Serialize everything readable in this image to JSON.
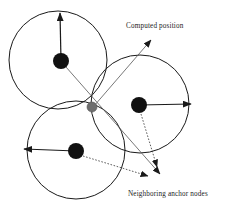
{
  "figure": {
    "type": "diagram",
    "width": 232,
    "height": 210,
    "background": "#ffffff"
  },
  "labels": {
    "computed_position": "Computed position",
    "neighboring_anchor_nodes": "Neighboring anchor nodes"
  },
  "colors": {
    "stroke": "#1a1a1a",
    "anchor_node_fill": "#111111",
    "computed_node_fill": "#6e6e6e",
    "leader_line": "#4a4a4a",
    "circle_stroke": "#1a1a1a",
    "text": "#1a1a1a",
    "background": "#ffffff"
  },
  "geometry": {
    "circles": [
      {
        "name": "range-circle-top-left",
        "cx": 58,
        "cy": 60,
        "r": 49
      },
      {
        "name": "range-circle-right",
        "cx": 140,
        "cy": 104,
        "r": 49
      },
      {
        "name": "range-circle-bottom-left",
        "cx": 76,
        "cy": 150,
        "r": 49
      }
    ],
    "anchor_nodes": [
      {
        "name": "anchor-node-top-left",
        "cx": 61,
        "cy": 61,
        "r": 8
      },
      {
        "name": "anchor-node-right",
        "cx": 139,
        "cy": 105,
        "r": 8
      },
      {
        "name": "anchor-node-bottom-left",
        "cx": 76,
        "cy": 151,
        "r": 8
      }
    ],
    "computed_node": {
      "name": "computed-position-node",
      "cx": 92,
      "cy": 107,
      "r": 5
    },
    "radius_arrows": [
      {
        "name": "radius-arrow-top-left",
        "x1": 61,
        "y1": 61,
        "x2": 60,
        "y2": 12
      },
      {
        "name": "radius-arrow-right",
        "x1": 139,
        "y1": 105,
        "x2": 192,
        "y2": 104
      },
      {
        "name": "radius-arrow-bottom-left",
        "x1": 76,
        "y1": 151,
        "x2": 23,
        "y2": 149
      }
    ],
    "leader_lines": [
      {
        "name": "leader-line-computed-position",
        "x1": 94,
        "y1": 106,
        "x2": 151,
        "y2": 40,
        "style": "solid-thin"
      },
      {
        "name": "leader-line-anchor-top-left",
        "x1": 66,
        "y1": 67,
        "x2": 160,
        "y2": 175,
        "style": "solid-thin"
      },
      {
        "name": "leader-line-anchor-right",
        "x1": 140,
        "y1": 113,
        "x2": 156,
        "y2": 168,
        "style": "dotted"
      },
      {
        "name": "leader-line-anchor-bottom-left",
        "x1": 83,
        "y1": 155,
        "x2": 147,
        "y2": 177,
        "style": "dotted"
      }
    ]
  }
}
